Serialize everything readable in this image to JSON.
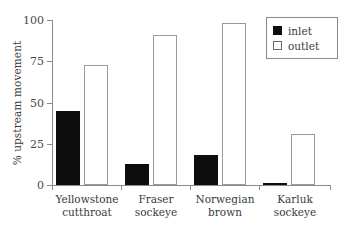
{
  "chart_data": {
    "type": "bar",
    "title": "",
    "xlabel": "",
    "ylabel": "% upstream movement",
    "ylim": [
      0,
      100
    ],
    "yticks": [
      0,
      25,
      50,
      75,
      100
    ],
    "ytick_labels": [
      "0",
      "25",
      "50",
      "75",
      "100"
    ],
    "grid": false,
    "legend_position": "top-right",
    "categories": [
      "Yellowstone cutthroat",
      "Fraser sockeye",
      "Norwegian brown",
      "Karluk sockeye"
    ],
    "category_lines": [
      [
        "Yellowstone",
        "cutthroat"
      ],
      [
        "Fraser",
        "sockeye"
      ],
      [
        "Norwegian",
        "brown"
      ],
      [
        "Karluk",
        "sockeye"
      ]
    ],
    "series": [
      {
        "name": "inlet",
        "color": "#0d0d0d",
        "fill": "solid",
        "values": [
          45,
          13,
          18,
          1
        ]
      },
      {
        "name": "outlet",
        "color": "#ffffff",
        "fill": "hollow",
        "values": [
          73,
          91,
          98,
          31
        ]
      }
    ]
  },
  "legend": {
    "entries": [
      {
        "label": "inlet"
      },
      {
        "label": "outlet"
      }
    ]
  },
  "axis": {
    "y_label": "% upstream movement"
  }
}
